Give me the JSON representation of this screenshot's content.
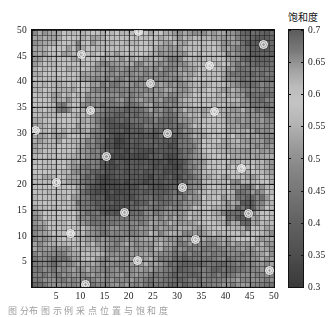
{
  "figure": {
    "kind": "heatmap-with-colorbar",
    "background": "#ffffff"
  },
  "caption": {
    "text": "图       分布 图 示 例 采 点 位 置 与 饱 和 度"
  },
  "colorbar": {
    "title": "饱和度",
    "tick_labels": [
      "0.7",
      "0.65",
      "0.6",
      "0.55",
      "0.5",
      "0.45",
      "0.4",
      "0.35",
      "0.3"
    ],
    "min": 0.3,
    "max": 0.7,
    "step": 0.05,
    "orientation": "vertical",
    "colormap": "gray-band"
  },
  "axes": {
    "x_tick_labels": [
      "5",
      "10",
      "15",
      "20",
      "25",
      "30",
      "35",
      "40",
      "45",
      "50"
    ],
    "y_tick_labels": [
      "50",
      "45",
      "40",
      "35",
      "30",
      "25",
      "20",
      "15",
      "10",
      "5"
    ],
    "x_range": [
      0,
      50
    ],
    "y_range": [
      0,
      50
    ],
    "grid": true
  },
  "chart_data": {
    "type": "heatmap",
    "title": "",
    "xlabel": "",
    "ylabel": "",
    "colorbar_label": "饱和度",
    "xlim": [
      0,
      50
    ],
    "ylim": [
      0,
      50
    ],
    "zlim": [
      0.3,
      0.7
    ],
    "grid": true,
    "nx": 50,
    "ny": 50,
    "cell_size": 1,
    "colormap": "gray",
    "x": [
      1,
      2,
      3,
      4,
      5,
      6,
      7,
      8,
      9,
      10,
      11,
      12,
      13,
      14,
      15,
      16,
      17,
      18,
      19,
      20,
      21,
      22,
      23,
      24,
      25,
      26,
      27,
      28,
      29,
      30,
      31,
      32,
      33,
      34,
      35,
      36,
      37,
      38,
      39,
      40,
      41,
      42,
      43,
      44,
      45,
      46,
      47,
      48,
      49,
      50
    ],
    "y": [
      1,
      2,
      3,
      4,
      5,
      6,
      7,
      8,
      9,
      10,
      11,
      12,
      13,
      14,
      15,
      16,
      17,
      18,
      19,
      20,
      21,
      22,
      23,
      24,
      25,
      26,
      27,
      28,
      29,
      30,
      31,
      32,
      33,
      34,
      35,
      36,
      37,
      38,
      39,
      40,
      41,
      42,
      43,
      44,
      45,
      46,
      47,
      48,
      49,
      50
    ],
    "field_model": {
      "note": "Saturation field reconstructed as a smooth multi-gaussian surface plus fine-grained cell noise, matching the rendered 50x50 pcolor texture.",
      "base": 0.47,
      "noise_amplitude": 0.055,
      "blobs": [
        {
          "cx": 10,
          "cy": 45,
          "sx": 9,
          "sy": 7,
          "amp": 0.16
        },
        {
          "cx": 6,
          "cy": 33,
          "sx": 7,
          "sy": 8,
          "amp": 0.13
        },
        {
          "cx": 5,
          "cy": 20,
          "sx": 6,
          "sy": 7,
          "amp": 0.12
        },
        {
          "cx": 9,
          "cy": 11,
          "sx": 7,
          "sy": 6,
          "amp": 0.1
        },
        {
          "cx": 22,
          "cy": 49,
          "sx": 8,
          "sy": 5,
          "amp": 0.09
        },
        {
          "cx": 37,
          "cy": 43,
          "sx": 6,
          "sy": 6,
          "amp": 0.14
        },
        {
          "cx": 36,
          "cy": 30,
          "sx": 5,
          "sy": 9,
          "amp": 0.12
        },
        {
          "cx": 42,
          "cy": 19,
          "sx": 7,
          "sy": 8,
          "amp": 0.15
        },
        {
          "cx": 45,
          "cy": 14,
          "sx": 6,
          "sy": 6,
          "amp": 0.12
        },
        {
          "cx": 24,
          "cy": 6,
          "sx": 7,
          "sy": 5,
          "amp": 0.1
        },
        {
          "cx": 30,
          "cy": 13,
          "sx": 8,
          "sy": 6,
          "amp": 0.08
        },
        {
          "cx": 18,
          "cy": 31,
          "sx": 6,
          "sy": 5,
          "amp": -0.09
        },
        {
          "cx": 28,
          "cy": 24,
          "sx": 9,
          "sy": 8,
          "amp": -0.11
        },
        {
          "cx": 16,
          "cy": 17,
          "sx": 7,
          "sy": 7,
          "amp": -0.1
        },
        {
          "cx": 46,
          "cy": 45,
          "sx": 6,
          "sy": 6,
          "amp": -0.09
        },
        {
          "cx": 14,
          "cy": 41,
          "sx": 5,
          "sy": 5,
          "amp": -0.07
        },
        {
          "cx": 33,
          "cy": 5,
          "sx": 8,
          "sy": 5,
          "amp": -0.08
        },
        {
          "cx": 25,
          "cy": 36,
          "sx": 6,
          "sy": 5,
          "amp": 0.07
        }
      ]
    },
    "markers": {
      "name": "sample-points",
      "style": "circle",
      "edge_color": "#f2f2f2",
      "count": 20,
      "points": [
        {
          "x": 21.8,
          "y": 49.9
        },
        {
          "x": 47.7,
          "y": 47.4
        },
        {
          "x": 10.1,
          "y": 45.5
        },
        {
          "x": 36.5,
          "y": 43.3
        },
        {
          "x": 24.3,
          "y": 39.7
        },
        {
          "x": 11.9,
          "y": 34.5
        },
        {
          "x": 37.6,
          "y": 34.3
        },
        {
          "x": 0.6,
          "y": 30.7
        },
        {
          "x": 27.8,
          "y": 30.1
        },
        {
          "x": 15.2,
          "y": 25.6
        },
        {
          "x": 43.1,
          "y": 23.3
        },
        {
          "x": 4.8,
          "y": 20.5
        },
        {
          "x": 30.8,
          "y": 19.6
        },
        {
          "x": 18.9,
          "y": 14.6
        },
        {
          "x": 44.6,
          "y": 14.4
        },
        {
          "x": 7.8,
          "y": 10.6
        },
        {
          "x": 33.6,
          "y": 9.5
        },
        {
          "x": 21.6,
          "y": 5.4
        },
        {
          "x": 48.8,
          "y": 3.5
        },
        {
          "x": 10.8,
          "y": 0.7
        }
      ]
    }
  }
}
